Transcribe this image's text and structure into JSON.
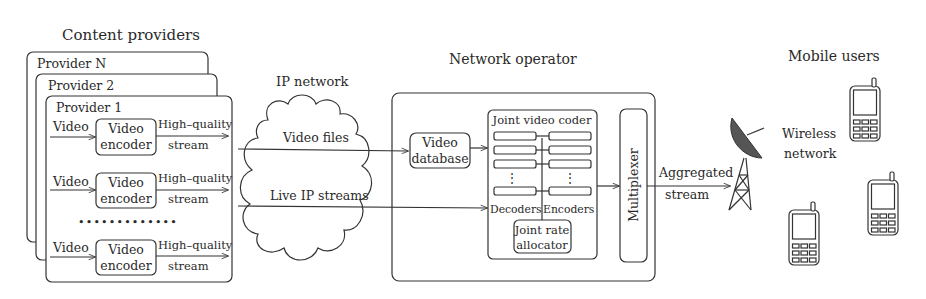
{
  "sections": {
    "content_providers": "Content providers",
    "ip_network": "IP network",
    "network_operator": "Network operator",
    "mobile_users": "Mobile users"
  },
  "providers": [
    {
      "label": "Provider N"
    },
    {
      "label": "Provider 2"
    },
    {
      "label": "Provider 1"
    }
  ],
  "encoder_rows": [
    {
      "input": "Video",
      "encoder_line1": "Video",
      "encoder_line2": "encoder",
      "output_line1": "High–quality",
      "output_line2": "stream"
    },
    {
      "input": "Video",
      "encoder_line1": "Video",
      "encoder_line2": "encoder",
      "output_line1": "High–quality",
      "output_line2": "stream"
    },
    {
      "input": "Video",
      "encoder_line1": "Video",
      "encoder_line2": "encoder",
      "output_line1": "High–quality",
      "output_line2": "stream"
    }
  ],
  "ellipsis": "•••••••••••••",
  "network": {
    "video_files": "Video files",
    "live_streams": "Live IP streams"
  },
  "operator": {
    "database_line1": "Video",
    "database_line2": "database",
    "joint_coder_title": "Joint video coder",
    "decoders": "Decoders",
    "encoders": "Encoders",
    "rate_allocator_line1": "Joint rate",
    "rate_allocator_line2": "allocator",
    "multiplexer": "Multiplexer",
    "vdots": "⋮"
  },
  "output": {
    "aggregated_line1": "Aggregated",
    "aggregated_line2": "stream",
    "wireless_line1": "Wireless",
    "wireless_line2": "network"
  },
  "icons": {
    "tower": "satellite-dish-tower-icon",
    "phone": "mobile-phone-icon"
  }
}
